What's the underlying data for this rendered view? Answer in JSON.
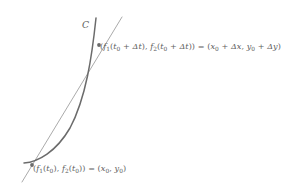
{
  "figure": {
    "curve_label": "C",
    "colors": {
      "curve": "#6b6b6b",
      "secant": "#8d8d8d",
      "point": "#6b6b6b",
      "text": "#5e5e5e",
      "background": "#ffffff"
    },
    "geometry": {
      "curve_path": "M 96 18 C 92 56, 86 98, 70 128 C 56 152, 38 162, 24 163",
      "secant_line": {
        "x1": 22,
        "y1": 182,
        "x2": 122,
        "y2": 17
      },
      "points": [
        {
          "name": "upper-intersection",
          "x": 99,
          "y": 45,
          "r": 1.9
        },
        {
          "name": "lower-intersection",
          "x": 32,
          "y": 165,
          "r": 1.9
        }
      ],
      "curve_stroke_width": 1.5,
      "secant_stroke_width": 0.75
    }
  },
  "labels": {
    "top": {
      "full_text": "(f1(t0 + Δt), f2(t0 + Δt)) = (x0 + Δx, y0 + Δy)",
      "open_paren": "(",
      "f1": "f",
      "f1_sub": "1",
      "t_open": "(",
      "t1": "t",
      "t1_sub": "0",
      "plus1": " + ",
      "delta_t1": "Δt",
      "t_close": "),",
      "f2": "f",
      "f2_sub": "2",
      "t2_open": "(",
      "t2": "t",
      "t2_sub": "0",
      "plus2": " + ",
      "delta_t2": "Δt",
      "close_paren": "))",
      "equals": " = ",
      "r_open": "(",
      "x": "x",
      "x_sub": "0",
      "plus3": " + ",
      "delta_x": "Δx",
      "comma": ", ",
      "y": "y",
      "y_sub": "0",
      "plus4": " + ",
      "delta_y": "Δy",
      "r_close": ")"
    },
    "bottom": {
      "full_text": "(f1(t0), f2(t0)) = (x0, y0)",
      "open_paren": "(",
      "f1": "f",
      "f1_sub": "1",
      "t_open": "(",
      "t1": "t",
      "t1_sub": "0",
      "t_close": "),",
      "f2": "f",
      "f2_sub": "2",
      "t2_open": "(",
      "t2": "t",
      "t2_sub": "0",
      "close_paren": "))",
      "equals": " = ",
      "r_open": "(",
      "x": "x",
      "x_sub": "0",
      "comma": ", ",
      "y": "y",
      "y_sub": "0",
      "r_close": ")"
    }
  }
}
